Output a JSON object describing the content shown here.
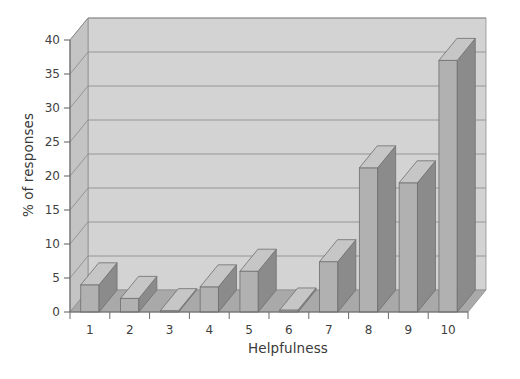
{
  "chart_data": {
    "type": "bar",
    "title": "",
    "subtitle": "",
    "xlabel": "Helpfulness",
    "ylabel": "% of responses",
    "categories": [
      "1",
      "2",
      "3",
      "4",
      "5",
      "6",
      "7",
      "8",
      "9",
      "10"
    ],
    "values": [
      4.0,
      2.0,
      0.2,
      3.7,
      6.0,
      0.3,
      7.4,
      21.2,
      19.0,
      37.0
    ],
    "series": [
      {
        "name": "% of responses",
        "values": [
          4.0,
          2.0,
          0.2,
          3.7,
          6.0,
          0.3,
          7.4,
          21.2,
          19.0,
          37.0
        ]
      }
    ],
    "ylim": [
      0,
      40
    ],
    "xlim": [
      0,
      11
    ],
    "yticks": [
      0,
      5,
      10,
      15,
      20,
      25,
      30,
      35,
      40
    ],
    "ytick_labels": [
      "0",
      "5",
      "10",
      "15",
      "20",
      "25",
      "30",
      "35",
      "40"
    ],
    "xtick_labels": [
      "1",
      "2",
      "3",
      "4",
      "5",
      "6",
      "7",
      "8",
      "9",
      "10"
    ],
    "grid": true,
    "grid_axis": "y",
    "legend": false,
    "legend_position": "none",
    "style": "3d",
    "annotations": []
  },
  "colors": {
    "background": "#ffffff",
    "wall": "#d3d3d3",
    "wall_side": "#c4c4c4",
    "floor": "#a9a9a9",
    "floor_front": "#9b9b9b",
    "gridline": "#8f8f8f",
    "bar_front": "#b1b1b1",
    "bar_side": "#8b8b8b",
    "bar_top": "#c6c6c6",
    "bar_outline": "#6e6e6e",
    "axis": "#6b6b6b",
    "text": "#3a3a3a"
  }
}
